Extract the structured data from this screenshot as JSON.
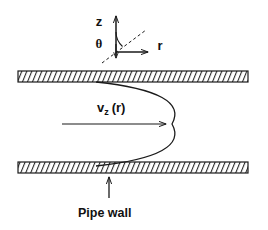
{
  "figure": {
    "title_text": "",
    "background_color": "#ffffff",
    "line_color": "#1a1a1a",
    "wall_fill_color": "#ffffff"
  },
  "coordinate_system": {
    "name": "cylindrical-coordinates",
    "axis_z_label": "z",
    "axis_r_label": "r",
    "angle_label": "θ",
    "origin_x": 116,
    "origin_y": 52,
    "z_axis_tip_y": 14,
    "r_axis_tip_x": 152,
    "dashed_ray_label": "theta-reference-dashed-line",
    "down_arrow_label": "negative-z-tick"
  },
  "pipe": {
    "name": "pipe-channel",
    "top_wall_label": "top-pipe-wall",
    "bottom_wall_label": "bottom-pipe-wall",
    "wall_left_x": 18,
    "wall_right_x": 248,
    "top_wall_y": 71,
    "bottom_wall_y": 162,
    "wall_thickness": 11,
    "hatch_direction": "forward-slash",
    "hatch_spacing": 5
  },
  "velocity_profile": {
    "name": "parabolic-velocity-profile",
    "label_main": "v",
    "label_subscript": "z",
    "label_argument": "(r)",
    "full_label": "v_z (r)",
    "curve_type": "parabola",
    "opens": "left",
    "vertex_x": 172,
    "vertex_y": 124,
    "top_attach_x": 96,
    "top_attach_y": 82,
    "bottom_attach_x": 96,
    "bottom_attach_y": 166,
    "arrow_start_x": 62,
    "arrow_end_x": 170,
    "arrow_y": 124
  },
  "annotations": {
    "pipe_wall_caption": "Pipe wall",
    "pipe_wall_caption_x": 78,
    "pipe_wall_caption_y": 213,
    "pipe_wall_arrow_label": "pipe-wall-pointer-arrow",
    "pipe_wall_arrow_x": 109,
    "pipe_wall_arrow_from_y": 196,
    "pipe_wall_arrow_to_y": 174
  }
}
